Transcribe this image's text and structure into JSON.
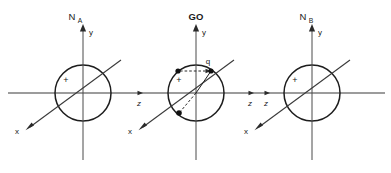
{
  "diagram": {
    "title_visible": false,
    "background_color": "#ffffff",
    "line_color": "#2a2a2a",
    "circle_color": "#1d1d1d",
    "frames": [
      {
        "id": "frame-na",
        "name": "N",
        "subscript": "A",
        "bold": false,
        "y_axis_label": "y",
        "x_axis_label": "x",
        "polarity_label": "+",
        "center_x": 83,
        "center_y": 93,
        "radius": 28
      },
      {
        "id": "frame-go",
        "name": "GO",
        "subscript": "",
        "bold": true,
        "y_axis_label": "y",
        "x_axis_label": "x",
        "polarity_label": "+",
        "charge_label": "q",
        "center_x": 196,
        "center_y": 93,
        "radius": 28
      },
      {
        "id": "frame-nb",
        "name": "N",
        "subscript": "B",
        "bold": false,
        "y_axis_label": "y",
        "x_axis_label": "x",
        "polarity_label": "+",
        "center_x": 312,
        "center_y": 93,
        "radius": 28
      }
    ],
    "z_axis_labels": [
      {
        "id": "z-label-1",
        "text": "z",
        "x": 139,
        "y": 104
      },
      {
        "id": "z-label-2",
        "text": "z",
        "x": 250,
        "y": 104
      },
      {
        "id": "z-label-3",
        "text": "z",
        "x": 266,
        "y": 104
      }
    ],
    "charges": [
      {
        "id": "charge-left",
        "x": 178,
        "y": 71
      },
      {
        "id": "charge-right",
        "x": 211,
        "y": 71
      },
      {
        "id": "charge-lower",
        "x": 179,
        "y": 113
      }
    ]
  }
}
